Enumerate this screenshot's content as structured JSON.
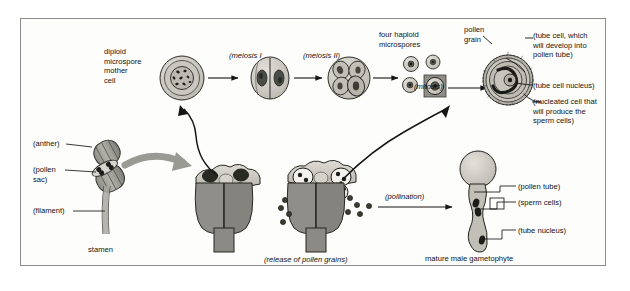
{
  "diagram": {
    "frame_color": "#8c8c8c",
    "background": "#fdfdfc",
    "ink": "#121212"
  },
  "labels": {
    "diploid_mother_cell": "diploid\nmicrospore\nmother\ncell",
    "meiosis_i": "(meiosis I",
    "meiosis_ii": "(meiosis II)",
    "four_haploid": "four haploid\nmicrospores",
    "mitosis": "(mitosis)",
    "pollen_grain": "pollen\ngrain",
    "tube_cell": "(tube cell, which\nwill develop into\npollen tube)",
    "tube_cell_nucleus": "(tube cell nucleus)",
    "nucleated_cell": "(nucleated cell that\nwill produce the\nsperm cells)",
    "anther": "(anther)",
    "pollen_sac": "(pollen\nsac)",
    "filament": "(filament)",
    "stamen": "stamen",
    "release": "(release of pollen grains)",
    "pollination": "(pollination)",
    "pollen_tube": "(pollen tube)",
    "sperm_cells": "(sperm cells)",
    "tube_nucleus": "(tube nucleus)",
    "mature_gametophyte": "mature male gametophyte"
  },
  "stages": [
    {
      "id": "mother-cell",
      "caption": "diploid microspore mother cell"
    },
    {
      "id": "meiosis-i-cell",
      "caption": "(meiosis I"
    },
    {
      "id": "meiosis-ii-cell",
      "caption": "(meiosis II)"
    },
    {
      "id": "four-microspores",
      "caption": "four haploid microspores"
    },
    {
      "id": "pollen-grain",
      "caption": "pollen grain"
    },
    {
      "id": "mature-male-gametophyte",
      "caption": "mature male gametophyte"
    }
  ],
  "colors": {
    "cell_fill": "#cfcdc6",
    "cell_mid": "#b6b3aa",
    "nucleus": "#4a4a46",
    "anther_dark": "#8b8b85",
    "anther_light": "#d9d7d0",
    "arrow": "#151515",
    "big_arrow": "#9a9a94"
  }
}
